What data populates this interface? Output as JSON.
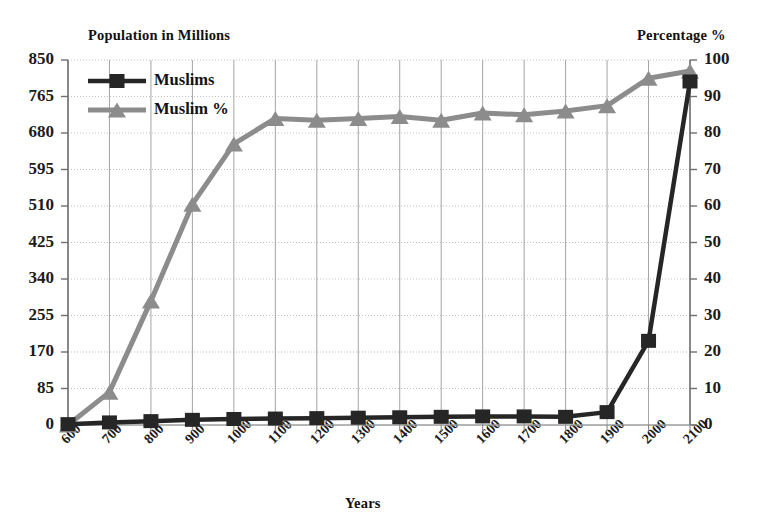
{
  "chart_data": {
    "type": "line",
    "title": "",
    "xlabel": "Years",
    "left_axis_title": "Population in Millions",
    "right_axis_title": "Percentage %",
    "grid": true,
    "legend_position": "top-left",
    "x": [
      600,
      700,
      800,
      900,
      1000,
      1100,
      1200,
      1300,
      1400,
      1500,
      1600,
      1700,
      1800,
      1900,
      2000,
      2100
    ],
    "categories": [
      "600",
      "700",
      "800",
      "900",
      "1000",
      "1100",
      "1200",
      "1300",
      "1400",
      "1500",
      "1600",
      "1700",
      "1800",
      "1900",
      "2000",
      "2100"
    ],
    "left_ticks": [
      "0",
      "85",
      "170",
      "255",
      "340",
      "425",
      "510",
      "595",
      "680",
      "765",
      "850"
    ],
    "left_tick_values": [
      0,
      85,
      170,
      255,
      340,
      425,
      510,
      595,
      680,
      765,
      850
    ],
    "right_ticks": [
      "0",
      "10",
      "20",
      "30",
      "40",
      "50",
      "60",
      "70",
      "80",
      "90",
      "100"
    ],
    "right_tick_values": [
      0,
      10,
      20,
      30,
      40,
      50,
      60,
      70,
      80,
      90,
      100
    ],
    "ylim": [
      0,
      850
    ],
    "y2lim": [
      0,
      100
    ],
    "series": [
      {
        "name": "Muslims",
        "axis": "left",
        "color": "#262626",
        "marker": "square",
        "values": [
          2,
          6,
          9,
          12,
          14,
          15,
          16,
          17,
          18,
          19,
          20,
          20,
          19,
          30,
          196,
          800
        ]
      },
      {
        "name": "Muslim %",
        "axis": "right",
        "color": "#8c8c8c",
        "marker": "triangle",
        "values": [
          0,
          9,
          34,
          60.5,
          77,
          84,
          83.5,
          84,
          84.5,
          83.5,
          85.5,
          85,
          86,
          87.5,
          95,
          97
        ]
      }
    ]
  },
  "legend": {
    "items": [
      {
        "label": "Muslims"
      },
      {
        "label": "Muslim %"
      }
    ]
  },
  "colors": {
    "muslims": "#262626",
    "muslim_pct": "#8c8c8c",
    "grid": "#b9b9b9",
    "axis": "#7a7a7a",
    "text": "#1b1b1b"
  }
}
